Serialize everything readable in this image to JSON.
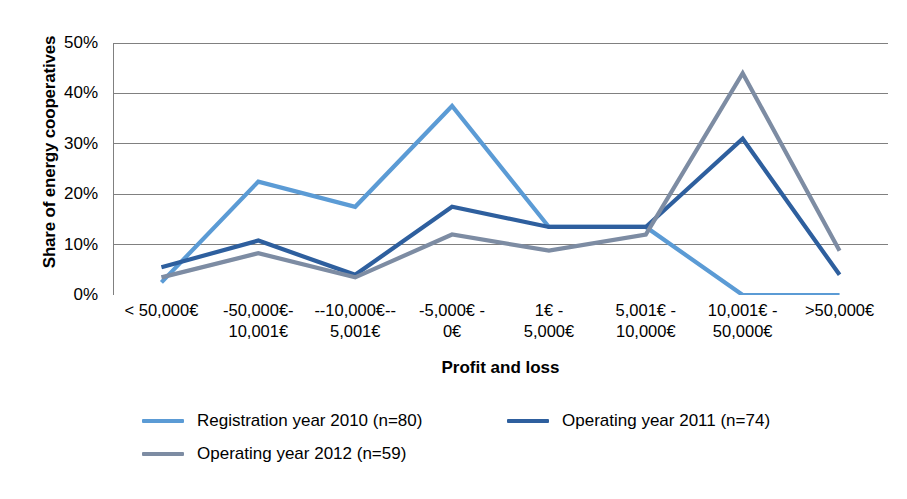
{
  "chart_data": {
    "type": "line",
    "title": "",
    "xlabel": "Profit and loss",
    "ylabel": "Share of energy cooperatives",
    "ylim": [
      0,
      50
    ],
    "yticks": [
      0,
      10,
      20,
      30,
      40,
      50
    ],
    "ytick_labels": [
      "0%",
      "10%",
      "20%",
      "30%",
      "40%",
      "50%"
    ],
    "y_unit": "%",
    "grid": "horizontal",
    "legend_position": "bottom",
    "categories": [
      "< 50,000€",
      "-50,000€-\n10,001€",
      "--10,000€--\n5,001€",
      "-5,000€ -\n0€",
      "1€ -\n5,000€",
      "5,001€ -\n10,000€",
      "10,001€ -\n50,000€",
      ">50,000€"
    ],
    "series": [
      {
        "name": "Registration year 2010 (n=80)",
        "color": "#5B9BD5",
        "values": [
          2.5,
          22.5,
          17.5,
          37.5,
          13.5,
          13.5,
          0.0,
          0.0
        ]
      },
      {
        "name": "Operating year 2011 (n=74)",
        "color": "#2E5F9E",
        "values": [
          5.5,
          10.8,
          4.0,
          17.5,
          13.5,
          13.5,
          31.0,
          4.0
        ]
      },
      {
        "name": "Operating year 2012 (n=59)",
        "color": "#7D8CA3",
        "values": [
          3.5,
          8.3,
          3.5,
          12.0,
          8.8,
          12.0,
          44.0,
          8.8
        ]
      }
    ],
    "axis_color": "#808080",
    "grid_color": "#808080"
  }
}
